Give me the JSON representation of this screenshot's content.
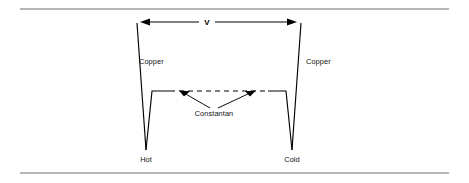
{
  "figure": {
    "kind": "thermocouple-circuit-diagram",
    "background_color": "#ffffff",
    "line_color": "#000000",
    "rule_color": "#6f6f6f",
    "width": 469,
    "height": 183
  },
  "dimension": {
    "label": "V",
    "description": "voltage measured across the copper leads",
    "left_x": 140,
    "right_x": 297,
    "y": 22
  },
  "labels": {
    "copper_left": "Copper",
    "copper_right": "Copper",
    "constantan": "Constantan",
    "hot_junction": "Hot",
    "cold_junction": "Cold"
  },
  "junctions": [
    {
      "name": "Hot",
      "x": 146,
      "y": 150
    },
    {
      "name": "Cold",
      "x": 292,
      "y": 150
    }
  ],
  "conductors": [
    {
      "name": "copper-left",
      "material": "Copper",
      "style": "solid"
    },
    {
      "name": "copper-right",
      "material": "Copper",
      "style": "solid"
    },
    {
      "name": "constantan-link",
      "material": "Constantan",
      "style": "dashed-center"
    }
  ],
  "rules": {
    "top_y": 9,
    "bottom_y": 173,
    "left_x": 20,
    "right_x": 449
  }
}
